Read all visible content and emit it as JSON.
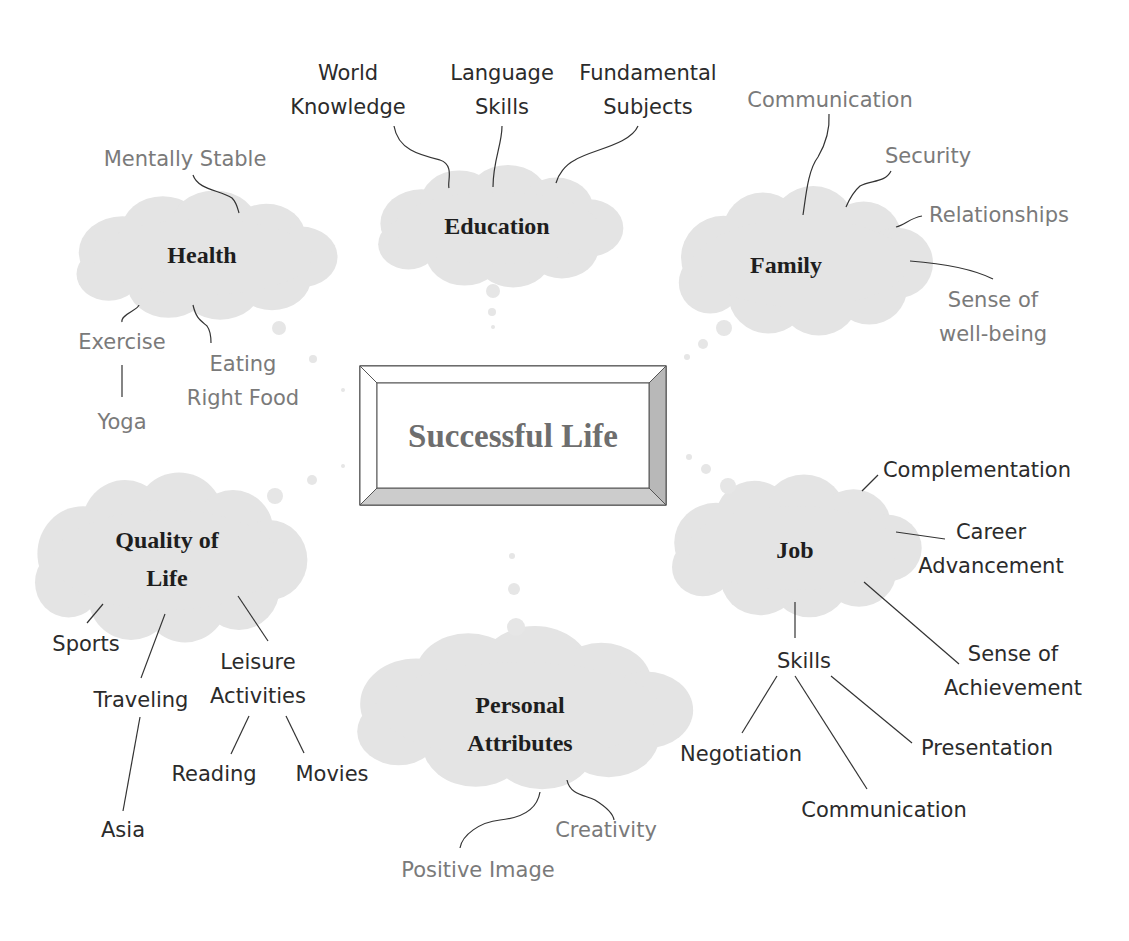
{
  "center": {
    "title": "Successful Life"
  },
  "nodes": {
    "education": {
      "title": "Education",
      "children": [
        {
          "line1": "World",
          "line2": "Knowledge"
        },
        {
          "line1": "Language",
          "line2": "Skills"
        },
        {
          "line1": "Fundamental",
          "line2": "Subjects"
        }
      ]
    },
    "health": {
      "title": "Health",
      "children": {
        "mentally_stable": "Mentally Stable",
        "exercise": "Exercise",
        "yoga": "Yoga",
        "eating_line1": "Eating",
        "eating_line2": "Right Food"
      }
    },
    "family": {
      "title": "Family",
      "children": {
        "communication": "Communication",
        "security": "Security",
        "relationships": "Relationships",
        "wellbeing_line1": "Sense of",
        "wellbeing_line2": "well-being"
      }
    },
    "quality_of_life": {
      "title_line1": "Quality of",
      "title_line2": "Life",
      "children": {
        "sports": "Sports",
        "traveling": "Traveling",
        "asia": "Asia",
        "leisure_line1": "Leisure",
        "leisure_line2": "Activities",
        "reading": "Reading",
        "movies": "Movies"
      }
    },
    "job": {
      "title": "Job",
      "children": {
        "complementation": "Complementation",
        "career_line1": "Career",
        "career_line2": "Advancement",
        "achievement_line1": "Sense of",
        "achievement_line2": "Achievement",
        "skills": "Skills",
        "negotiation": "Negotiation",
        "communication": "Communication",
        "presentation": "Presentation"
      }
    },
    "personal_attributes": {
      "title_line1": "Personal",
      "title_line2": "Attributes",
      "children": {
        "creativity": "Creativity",
        "positive_image": "Positive Image"
      }
    }
  },
  "colors": {
    "cloud_fill": "#e4e4e4",
    "dark_text": "#2b2b2b",
    "gray_text": "#7a7a7a",
    "center_text": "#6e6e6e",
    "bevel_dark": "#b8b8b8",
    "bevel_mid": "#cccccc"
  }
}
